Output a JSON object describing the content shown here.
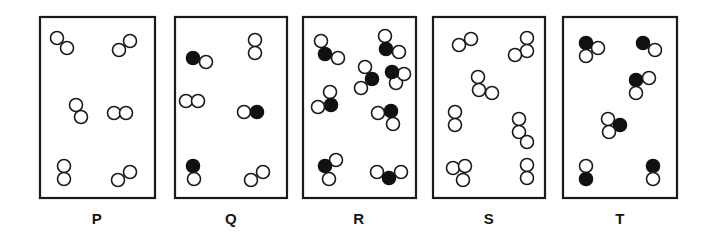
{
  "figure": {
    "type": "particle-diagram",
    "width": 705,
    "height": 243,
    "background_color": "#ffffff",
    "outline_color": "#1a1a1a",
    "open_circle_fill": "#ffffff",
    "filled_circle_fill": "#111111",
    "atom_radius": 6.5,
    "box_top": 17,
    "box_bottom": 198,
    "label_y": 224
  },
  "legend_note": {
    "open_circle_meaning": "open circle",
    "filled_circle_meaning": "filled circle"
  },
  "boxes": [
    {
      "label": "P",
      "name": "box-p",
      "x": 40,
      "y": 17,
      "width": 115,
      "height": 181,
      "label_x": 97,
      "molecule_count": 6,
      "composition_summary": "6 molecules, each 2 open circles",
      "molecules": [
        {
          "type": "open-open-pair",
          "atoms": [
            {
              "cx": 57,
              "cy": 38,
              "fill": "open"
            },
            {
              "cx": 67,
              "cy": 48,
              "fill": "open"
            }
          ]
        },
        {
          "type": "open-open-pair",
          "atoms": [
            {
              "cx": 119,
              "cy": 50,
              "fill": "open"
            },
            {
              "cx": 130,
              "cy": 41,
              "fill": "open"
            }
          ]
        },
        {
          "type": "open-open-pair",
          "atoms": [
            {
              "cx": 76,
              "cy": 105,
              "fill": "open"
            },
            {
              "cx": 81,
              "cy": 117,
              "fill": "open"
            }
          ]
        },
        {
          "type": "open-open-pair",
          "atoms": [
            {
              "cx": 114,
              "cy": 113,
              "fill": "open"
            },
            {
              "cx": 126,
              "cy": 113,
              "fill": "open"
            }
          ]
        },
        {
          "type": "open-open-pair",
          "atoms": [
            {
              "cx": 64,
              "cy": 166,
              "fill": "open"
            },
            {
              "cx": 64,
              "cy": 179,
              "fill": "open"
            }
          ]
        },
        {
          "type": "open-open-pair",
          "atoms": [
            {
              "cx": 118,
              "cy": 180,
              "fill": "open"
            },
            {
              "cx": 130,
              "cy": 172,
              "fill": "open"
            }
          ]
        }
      ]
    },
    {
      "label": "Q",
      "name": "box-q",
      "x": 175,
      "y": 17,
      "width": 112,
      "height": 181,
      "label_x": 231,
      "molecule_count": 6,
      "composition_summary": "3 molecules of 1 filled + 1 open, 3 molecules of 2 open circles",
      "molecules": [
        {
          "type": "filled-open-pair",
          "atoms": [
            {
              "cx": 193,
              "cy": 58,
              "fill": "filled"
            },
            {
              "cx": 206,
              "cy": 62,
              "fill": "open"
            }
          ]
        },
        {
          "type": "open-open-pair",
          "atoms": [
            {
              "cx": 255,
              "cy": 40,
              "fill": "open"
            },
            {
              "cx": 255,
              "cy": 53,
              "fill": "open"
            }
          ]
        },
        {
          "type": "open-open-pair",
          "atoms": [
            {
              "cx": 186,
              "cy": 101,
              "fill": "open"
            },
            {
              "cx": 198,
              "cy": 101,
              "fill": "open"
            }
          ]
        },
        {
          "type": "open-filled-pair",
          "atoms": [
            {
              "cx": 244,
              "cy": 112,
              "fill": "open"
            },
            {
              "cx": 257,
              "cy": 112,
              "fill": "filled"
            }
          ]
        },
        {
          "type": "filled-open-pair",
          "atoms": [
            {
              "cx": 193,
              "cy": 166,
              "fill": "filled"
            },
            {
              "cx": 194,
              "cy": 179,
              "fill": "open"
            }
          ]
        },
        {
          "type": "open-open-pair",
          "atoms": [
            {
              "cx": 251,
              "cy": 180,
              "fill": "open"
            },
            {
              "cx": 263,
              "cy": 172,
              "fill": "open"
            }
          ]
        }
      ]
    },
    {
      "label": "R",
      "name": "box-r",
      "x": 303,
      "y": 17,
      "width": 113,
      "height": 181,
      "label_x": 359,
      "molecule_count": 8,
      "composition_summary": "8 molecules, each 1 filled + 2 open circles",
      "molecules": [
        {
          "type": "filled-with-two-open",
          "atoms": [
            {
              "cx": 321,
              "cy": 41,
              "fill": "open"
            },
            {
              "cx": 325,
              "cy": 54,
              "fill": "filled"
            },
            {
              "cx": 338,
              "cy": 58,
              "fill": "open"
            }
          ]
        },
        {
          "type": "filled-with-two-open",
          "atoms": [
            {
              "cx": 385,
              "cy": 36,
              "fill": "open"
            },
            {
              "cx": 386,
              "cy": 49,
              "fill": "filled"
            },
            {
              "cx": 399,
              "cy": 52,
              "fill": "open"
            }
          ]
        },
        {
          "type": "filled-with-two-open",
          "atoms": [
            {
              "cx": 365,
              "cy": 67,
              "fill": "open"
            },
            {
              "cx": 372,
              "cy": 79,
              "fill": "filled"
            },
            {
              "cx": 361,
              "cy": 88,
              "fill": "open"
            }
          ]
        },
        {
          "type": "filled-with-two-open",
          "atoms": [
            {
              "cx": 330,
              "cy": 92,
              "fill": "open"
            },
            {
              "cx": 331,
              "cy": 105,
              "fill": "filled"
            },
            {
              "cx": 318,
              "cy": 107,
              "fill": "open"
            }
          ]
        },
        {
          "type": "filled-with-two-open",
          "atoms": [
            {
              "cx": 378,
              "cy": 113,
              "fill": "open"
            },
            {
              "cx": 391,
              "cy": 111,
              "fill": "filled"
            },
            {
              "cx": 393,
              "cy": 124,
              "fill": "open"
            }
          ]
        },
        {
          "type": "filled-with-two-open",
          "atoms": [
            {
              "cx": 336,
              "cy": 160,
              "fill": "open"
            },
            {
              "cx": 325,
              "cy": 166,
              "fill": "filled"
            },
            {
              "cx": 329,
              "cy": 179,
              "fill": "open"
            }
          ]
        },
        {
          "type": "filled-with-two-open",
          "atoms": [
            {
              "cx": 377,
              "cy": 172,
              "fill": "open"
            },
            {
              "cx": 389,
              "cy": 178,
              "fill": "filled"
            },
            {
              "cx": 401,
              "cy": 172,
              "fill": "open"
            }
          ]
        },
        {
          "type": "filled-with-two-open",
          "atoms": [
            {
              "cx": 396,
              "cy": 83,
              "fill": "open"
            },
            {
              "cx": 404,
              "cy": 74,
              "fill": "open"
            },
            {
              "cx": 392,
              "cy": 72,
              "fill": "filled"
            }
          ]
        }
      ]
    },
    {
      "label": "S",
      "name": "box-s",
      "x": 433,
      "y": 17,
      "width": 112,
      "height": 181,
      "label_x": 489,
      "molecule_count": 7,
      "composition_summary": "mixture of 2-circle and 3-circle molecules, all open circles",
      "molecules": [
        {
          "type": "open-open-pair",
          "atoms": [
            {
              "cx": 459,
              "cy": 45,
              "fill": "open"
            },
            {
              "cx": 471,
              "cy": 39,
              "fill": "open"
            }
          ]
        },
        {
          "type": "open-triplet",
          "atoms": [
            {
              "cx": 527,
              "cy": 38,
              "fill": "open"
            },
            {
              "cx": 527,
              "cy": 51,
              "fill": "open"
            },
            {
              "cx": 515,
              "cy": 55,
              "fill": "open"
            }
          ]
        },
        {
          "type": "open-triplet",
          "atoms": [
            {
              "cx": 478,
              "cy": 77,
              "fill": "open"
            },
            {
              "cx": 479,
              "cy": 90,
              "fill": "open"
            },
            {
              "cx": 492,
              "cy": 93,
              "fill": "open"
            }
          ]
        },
        {
          "type": "open-open-pair",
          "atoms": [
            {
              "cx": 455,
              "cy": 112,
              "fill": "open"
            },
            {
              "cx": 455,
              "cy": 125,
              "fill": "open"
            }
          ]
        },
        {
          "type": "open-triplet",
          "atoms": [
            {
              "cx": 519,
              "cy": 119,
              "fill": "open"
            },
            {
              "cx": 519,
              "cy": 132,
              "fill": "open"
            },
            {
              "cx": 527,
              "cy": 142,
              "fill": "open"
            }
          ]
        },
        {
          "type": "open-triplet",
          "atoms": [
            {
              "cx": 453,
              "cy": 168,
              "fill": "open"
            },
            {
              "cx": 465,
              "cy": 166,
              "fill": "open"
            },
            {
              "cx": 463,
              "cy": 180,
              "fill": "open"
            }
          ]
        },
        {
          "type": "open-open-pair",
          "atoms": [
            {
              "cx": 527,
              "cy": 165,
              "fill": "open"
            },
            {
              "cx": 527,
              "cy": 178,
              "fill": "open"
            }
          ]
        }
      ]
    },
    {
      "label": "T",
      "name": "box-t",
      "x": 563,
      "y": 17,
      "width": 114,
      "height": 181,
      "label_x": 620,
      "molecule_count": 6,
      "composition_summary": "3 molecules of 1 filled + 2 open, 3 molecules of 1 filled + 1 open",
      "molecules": [
        {
          "type": "filled-with-two-open",
          "atoms": [
            {
              "cx": 586,
              "cy": 43,
              "fill": "filled"
            },
            {
              "cx": 598,
              "cy": 48,
              "fill": "open"
            },
            {
              "cx": 586,
              "cy": 56,
              "fill": "open"
            }
          ]
        },
        {
          "type": "filled-open-pair",
          "atoms": [
            {
              "cx": 643,
              "cy": 43,
              "fill": "filled"
            },
            {
              "cx": 655,
              "cy": 50,
              "fill": "open"
            }
          ]
        },
        {
          "type": "filled-with-two-open",
          "atoms": [
            {
              "cx": 636,
              "cy": 80,
              "fill": "filled"
            },
            {
              "cx": 649,
              "cy": 78,
              "fill": "open"
            },
            {
              "cx": 636,
              "cy": 93,
              "fill": "open"
            }
          ]
        },
        {
          "type": "filled-with-two-open",
          "atoms": [
            {
              "cx": 608,
              "cy": 119,
              "fill": "open"
            },
            {
              "cx": 620,
              "cy": 125,
              "fill": "filled"
            },
            {
              "cx": 609,
              "cy": 132,
              "fill": "open"
            }
          ]
        },
        {
          "type": "open-filled-pair",
          "atoms": [
            {
              "cx": 586,
              "cy": 166,
              "fill": "open"
            },
            {
              "cx": 586,
              "cy": 179,
              "fill": "filled"
            }
          ]
        },
        {
          "type": "filled-open-pair",
          "atoms": [
            {
              "cx": 653,
              "cy": 166,
              "fill": "filled"
            },
            {
              "cx": 653,
              "cy": 179,
              "fill": "open"
            }
          ]
        }
      ]
    }
  ]
}
